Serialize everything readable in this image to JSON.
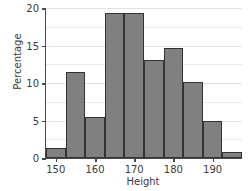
{
  "chart_data": {
    "type": "bar",
    "title": "",
    "xlabel": "Height",
    "ylabel": "Percentage",
    "xlim": [
      147.5,
      197.5
    ],
    "ylim": [
      0,
      20
    ],
    "bin_width": 5,
    "grid": true,
    "legend": null,
    "bar_color": "#808080",
    "bar_edge_color": "#333333",
    "axis_color": "#4a4a4a",
    "grid_color": "#e9e9e9",
    "xticks": [
      150,
      160,
      170,
      180,
      190
    ],
    "yticks": [
      0,
      5,
      10,
      15,
      20
    ],
    "gridlines": [
      2.5,
      5,
      7.5,
      10,
      12.5,
      15,
      17.5,
      20
    ],
    "xtick_labels": [
      "150",
      "160",
      "170",
      "180",
      "190"
    ],
    "ytick_labels": [
      "0",
      "5",
      "10",
      "15",
      "20"
    ],
    "categories": [
      "147.5-152.5",
      "152.5-157.5",
      "157.5-162.5",
      "162.5-167.5",
      "167.5-172.5",
      "172.5-177.5",
      "177.5-182.5",
      "182.5-187.5",
      "187.5-192.5",
      "192.5-197.5"
    ],
    "bin_edges": [
      147.5,
      152.5,
      157.5,
      162.5,
      167.5,
      172.5,
      177.5,
      182.5,
      187.5,
      192.5,
      197.5
    ],
    "values": [
      1.4,
      11.5,
      5.5,
      19.4,
      19.4,
      13.1,
      14.7,
      10.1,
      4.9,
      0.8
    ]
  }
}
